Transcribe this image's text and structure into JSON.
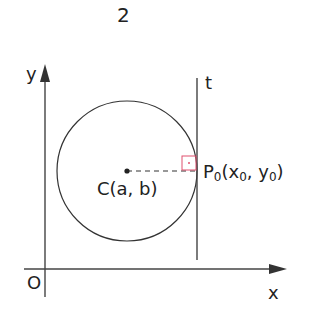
{
  "figure": {
    "number_label": "2"
  },
  "axes": {
    "x_label": "x",
    "y_label": "y",
    "origin_label": "O"
  },
  "tangent": {
    "label": "t"
  },
  "center": {
    "label": "C(a, b)"
  },
  "point": {
    "name": "P",
    "name_sub": "0",
    "open": "(x",
    "x_sub": "0",
    "sep": ", y",
    "y_sub": "0",
    "close": ")"
  },
  "colors": {
    "line": "#333333",
    "right_angle_marker": "#e0506e"
  }
}
